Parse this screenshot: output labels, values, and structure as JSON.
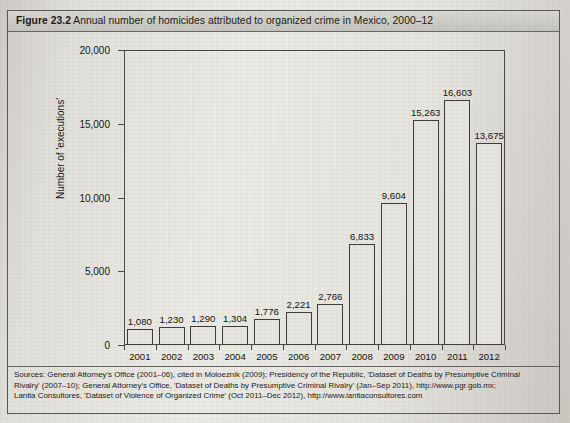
{
  "figure": {
    "number_label": "Figure 23.2",
    "caption": "Annual number of homicides attributed to organized crime in Mexico, 2000–12"
  },
  "sources": {
    "label": "Sources:",
    "lines": [
      "Sources:  General Attorney's Office (2001–06), cited in Moloeznik (2009); Presidency of the Republic, 'Dataset of Deaths by Presumptive Criminal",
      "Rivalry' (2007–10); General Attorney's Office, 'Dataset of Deaths by Presumptive Criminal Rivalry' (Jan–Sep 2011), http://www.pgr.gob.mx;",
      "Lantia Consultores, 'Dataset of Violence of Organized Crime' (Oct 2011–Dec 2012), http://www.lantiaconsultores.com"
    ]
  },
  "chart_data": {
    "type": "bar",
    "title": "Annual number of homicides attributed to organized crime in Mexico, 2000–12",
    "xlabel": "",
    "ylabel": "Number of 'executions'",
    "categories": [
      "2001",
      "2002",
      "2003",
      "2004",
      "2005",
      "2006",
      "2007",
      "2008",
      "2009",
      "2010",
      "2011",
      "2012"
    ],
    "values": [
      1080,
      1230,
      1290,
      1304,
      1776,
      2221,
      2766,
      6833,
      9604,
      15263,
      16603,
      13675
    ],
    "value_labels": [
      "1,080",
      "1,230",
      "1,290",
      "1,304",
      "1,776",
      "2,221",
      "2,766",
      "6,833",
      "9,604",
      "15,263",
      "16,603",
      "13,675"
    ],
    "ylim": [
      0,
      20000
    ],
    "yticks": [
      0,
      5000,
      10000,
      15000,
      20000
    ],
    "ytick_labels": [
      "0",
      "5,000",
      "10,000",
      "15,000",
      "20,000"
    ],
    "grid": false,
    "legend": null,
    "bar_fill_color": "#e6e5e2",
    "bar_border_color": "#3f3d3a"
  }
}
